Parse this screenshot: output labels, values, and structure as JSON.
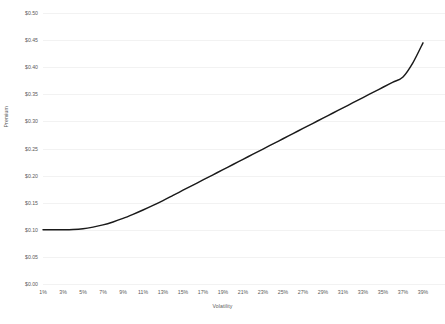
{
  "chart_data": {
    "type": "line",
    "title": "",
    "subtitle": "",
    "xlabel": "Volatility",
    "ylabel": "Premium",
    "grid": "horizontal",
    "legend": "none",
    "line_color": "#1a1a1a",
    "background_color": "#ffffff",
    "text_color": "#5a5a5a",
    "gridline_color": "#f2f2f2",
    "xlim": [
      1,
      39
    ],
    "ylim": [
      0.0,
      0.5
    ],
    "x_tick_labels": [
      "1%",
      "3%",
      "5%",
      "7%",
      "9%",
      "11%",
      "13%",
      "15%",
      "17%",
      "19%",
      "21%",
      "23%",
      "25%",
      "27%",
      "29%",
      "31%",
      "33%",
      "35%",
      "37%",
      "39%"
    ],
    "x_tick_values": [
      1,
      3,
      5,
      7,
      9,
      11,
      13,
      15,
      17,
      19,
      21,
      23,
      25,
      27,
      29,
      31,
      33,
      35,
      37,
      39
    ],
    "y_tick_labels": [
      "$0.00",
      "$0.05",
      "$0.10",
      "$0.15",
      "$0.20",
      "$0.25",
      "$0.30",
      "$0.35",
      "$0.40",
      "$0.45",
      "$0.50"
    ],
    "y_tick_values": [
      0.0,
      0.05,
      0.1,
      0.15,
      0.2,
      0.25,
      0.3,
      0.35,
      0.4,
      0.45,
      0.5
    ],
    "series": [
      {
        "name": "Premium",
        "x": [
          1,
          2,
          3,
          4,
          5,
          6,
          7,
          8,
          9,
          10,
          11,
          12,
          13,
          14,
          15,
          16,
          17,
          18,
          19,
          20,
          21,
          22,
          23,
          24,
          25,
          26,
          27,
          28,
          29,
          30,
          31,
          32,
          33,
          34,
          35,
          36,
          37,
          38,
          39
        ],
        "values": [
          0.1,
          0.1,
          0.1,
          0.1005,
          0.102,
          0.105,
          0.109,
          0.1145,
          0.121,
          0.1285,
          0.1365,
          0.145,
          0.154,
          0.1635,
          0.173,
          0.1825,
          0.192,
          0.2015,
          0.211,
          0.2205,
          0.23,
          0.2395,
          0.249,
          0.2585,
          0.268,
          0.2775,
          0.287,
          0.2965,
          0.306,
          0.3155,
          0.325,
          0.3345,
          0.344,
          0.3535,
          0.363,
          0.3725,
          0.382,
          0.4085,
          0.445
        ]
      }
    ]
  }
}
